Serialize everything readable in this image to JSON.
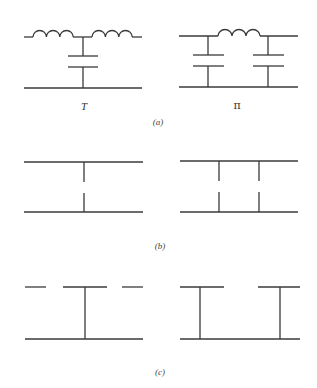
{
  "figure": {
    "panels": [
      {
        "id": "a",
        "caption": "(a)",
        "circuits": [
          {
            "name": "T",
            "description": "T-network: two series inductors on top line, shunt capacitor from junction to bottom line"
          },
          {
            "name": "π",
            "description": "Pi-network: one series inductor on top line, two shunt capacitors to bottom line"
          }
        ]
      },
      {
        "id": "b",
        "caption": "(b)",
        "circuits": [
          {
            "name": "",
            "description": "Single shunt gap between two parallel lines"
          },
          {
            "name": "",
            "description": "Two shunt gaps between two parallel lines"
          }
        ]
      },
      {
        "id": "c",
        "caption": "(c)",
        "circuits": [
          {
            "name": "",
            "description": "Gapped top line with one shunt stub to bottom line"
          },
          {
            "name": "",
            "description": "Gapped top line with two shunt stubs to bottom line"
          }
        ]
      }
    ]
  }
}
